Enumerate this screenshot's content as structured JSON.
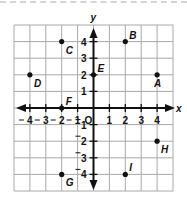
{
  "chart_data": {
    "type": "scatter",
    "title": "",
    "xlabel": "x",
    "ylabel": "y",
    "xlim": [
      -5,
      5
    ],
    "ylim": [
      -5,
      5
    ],
    "grid": true,
    "origin_label": "O",
    "x_ticks": [
      {
        "value": -4,
        "label": "4",
        "neg": true
      },
      {
        "value": -3,
        "label": "3",
        "neg": true
      },
      {
        "value": -2,
        "label": "2",
        "neg": true
      },
      {
        "value": -1,
        "label": "1",
        "neg": true
      },
      {
        "value": 1,
        "label": "1",
        "neg": false
      },
      {
        "value": 2,
        "label": "2",
        "neg": false
      },
      {
        "value": 3,
        "label": "3",
        "neg": false
      },
      {
        "value": 4,
        "label": "4",
        "neg": false
      }
    ],
    "y_ticks": [
      {
        "value": 4,
        "label": "4",
        "neg": false
      },
      {
        "value": 3,
        "label": "3",
        "neg": false
      },
      {
        "value": 2,
        "label": "2",
        "neg": false
      },
      {
        "value": 1,
        "label": "1",
        "neg": false
      },
      {
        "value": -1,
        "label": "1",
        "neg": true
      },
      {
        "value": -2,
        "label": "2",
        "neg": true
      },
      {
        "value": -3,
        "label": "3",
        "neg": true
      },
      {
        "value": -4,
        "label": "4",
        "neg": true
      }
    ],
    "points": [
      {
        "label": "A",
        "x": 4,
        "y": 2,
        "label_pos": "below"
      },
      {
        "label": "B",
        "x": 2,
        "y": 4,
        "label_pos": "upper-right"
      },
      {
        "label": "C",
        "x": -2,
        "y": 4,
        "label_pos": "below-right"
      },
      {
        "label": "D",
        "x": -4,
        "y": 2,
        "label_pos": "below-right"
      },
      {
        "label": "E",
        "x": 0,
        "y": 2,
        "label_pos": "upper-right"
      },
      {
        "label": "F",
        "x": -2,
        "y": 0,
        "label_pos": "upper-right"
      },
      {
        "label": "G",
        "x": -2,
        "y": -4,
        "label_pos": "below-right"
      },
      {
        "label": "H",
        "x": 4,
        "y": -2,
        "label_pos": "below-right"
      },
      {
        "label": "I",
        "x": 2,
        "y": -4,
        "label_pos": "upper-right"
      }
    ],
    "colors": {
      "grid": "#a8a8a8",
      "axis": "#111111",
      "point": "#111111",
      "top_dash": "#d4d4d4"
    }
  }
}
